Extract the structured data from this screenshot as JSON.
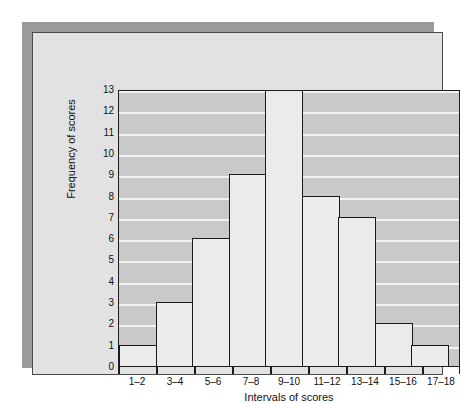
{
  "chart_data": {
    "type": "bar",
    "title": "",
    "categories": [
      "1–2",
      "3–4",
      "5–6",
      "7–8",
      "9–10",
      "11–12",
      "13–14",
      "15–16",
      "17–18"
    ],
    "values": [
      1,
      3,
      6,
      9,
      13,
      8,
      7,
      2,
      1
    ],
    "xlabel": "Intervals of scores",
    "ylabel": "Frequency of scores",
    "ylim": [
      0,
      13
    ],
    "ytick_labels": [
      "0",
      "1",
      "2",
      "3",
      "4",
      "5",
      "6",
      "7",
      "8",
      "9",
      "10",
      "11",
      "12",
      "13"
    ],
    "ytick_values": [
      0,
      1,
      2,
      3,
      4,
      5,
      6,
      7,
      8,
      9,
      10,
      11,
      12,
      13
    ],
    "grid": "horizontal",
    "legend": "none",
    "bar_gap": 0,
    "colors": {
      "bar_fill": "#ebebeb",
      "bar_outline": "#1a1a1a",
      "plot_background": "#c9c9c9",
      "gridline": "#f2f2f2",
      "panel_background": "#e2e2e2",
      "panel_border": "#4a4a4a",
      "shadow": "#9a9a9a",
      "page_background": "#ffffff",
      "text": "#111111"
    }
  }
}
